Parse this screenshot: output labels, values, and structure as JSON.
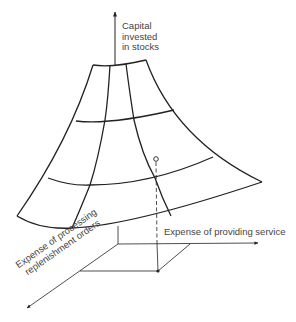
{
  "figure": {
    "type": "3d-surface-diagram",
    "colors": {
      "line": "#222222",
      "text": "#444444",
      "background": "#ffffff"
    },
    "axes": {
      "vertical": {
        "label_lines": [
          "Capital",
          "invested",
          "in stocks"
        ]
      },
      "horizontal": {
        "label": "Expense of providing service"
      },
      "depth": {
        "label_lines": [
          "Expense of processing",
          "replenishment orders"
        ]
      }
    },
    "surface": {
      "description": "Curved funnel-shaped surface with a 3x3 grid of cells",
      "grid_rows": 3,
      "grid_cols": 3
    },
    "marked_point": {
      "description": "Open circle on surface, dashed projection down to filled dot on base plane"
    }
  }
}
